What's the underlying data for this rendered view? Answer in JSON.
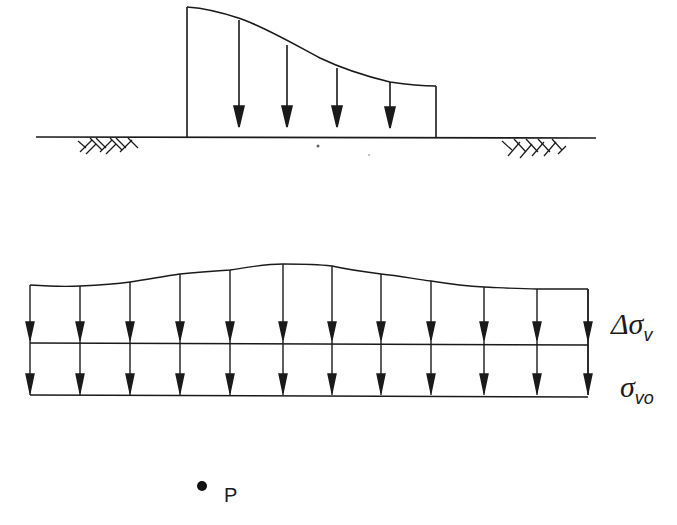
{
  "diagram": {
    "type": "stress distribution under surface load",
    "top": {
      "description": "Non-uniform surface load on ground with soil hatching",
      "load_left_x": 187,
      "load_right_x": 436,
      "ground_y": 137,
      "arrow_x": [
        239,
        287,
        337,
        390
      ]
    },
    "bottom": {
      "description": "Vertical stress profile at depth: stress increment above, initial vertical stress below",
      "left_x": 30,
      "right_x": 588,
      "arrow_x": [
        30,
        80,
        130,
        180,
        230,
        283,
        332,
        381,
        431,
        484,
        537,
        588
      ],
      "labels": {
        "increment_prefix": "Δσ",
        "increment_sub": "v",
        "initial_prefix": "σ",
        "initial_sub": "vo"
      }
    },
    "point": {
      "label": "P"
    },
    "colors": {
      "line": "#1a1a1a",
      "background": "#ffffff"
    }
  }
}
